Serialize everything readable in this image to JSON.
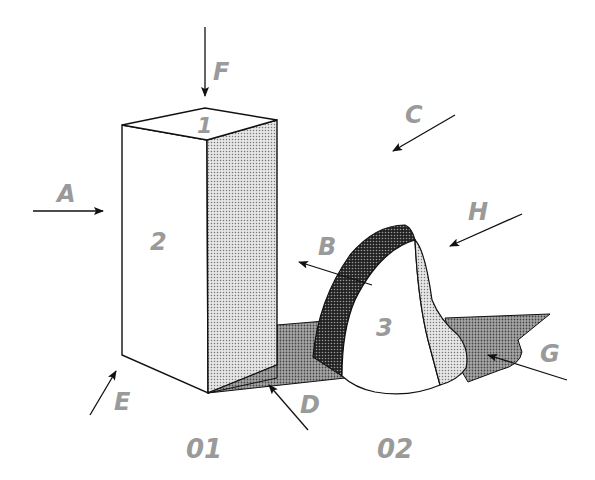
{
  "diagram": {
    "type": "3d-shape-lighting-illustration",
    "colors": {
      "label_gray": "#9a9a9a",
      "outline": "#111111",
      "light_dot_fill": "#cfcfcf",
      "medium_dot_fill": "#8a8a8a",
      "dark_dot_fill": "#3a3a3a",
      "background": "#ffffff"
    },
    "shape_labels": {
      "top_face": "1",
      "front_face": "2",
      "cone": "3"
    },
    "arrow_labels": {
      "A": "A",
      "B": "B",
      "C": "C",
      "D": "D",
      "E": "E",
      "F": "F",
      "G": "G",
      "H": "H"
    },
    "region_labels": {
      "left": "01",
      "right": "02"
    }
  }
}
